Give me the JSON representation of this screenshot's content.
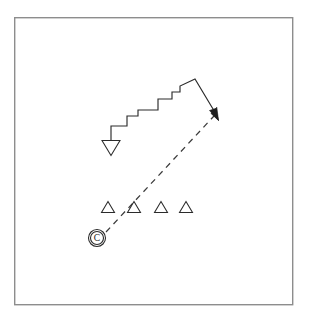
{
  "figure": {
    "title": "",
    "background_color": "#ffffff",
    "frame": {
      "name": "outer-frame",
      "x": 14,
      "y": 17,
      "width": 279,
      "height": 288,
      "stroke_color": "#8d8d8d",
      "fill_color": "#ffffff"
    }
  },
  "chart_data": {
    "type": "diagram",
    "title": "",
    "xlabel": "",
    "ylabel": "",
    "coordinate_space": [
      311,
      325
    ],
    "elements": [
      {
        "id": "route-staircase",
        "label": "staircase-route-path",
        "kind": "polyline",
        "stroke_color": "#2b2b2b",
        "stroke_width": 1.15,
        "dashed": false,
        "points": [
          [
            111,
            140
          ],
          [
            111,
            126
          ],
          [
            127,
            126
          ],
          [
            127,
            116
          ],
          [
            138,
            116
          ],
          [
            138,
            110
          ],
          [
            158,
            110
          ],
          [
            158,
            99
          ],
          [
            172,
            99
          ],
          [
            172,
            92
          ],
          [
            180,
            92
          ],
          [
            180,
            86
          ],
          [
            195,
            79
          ],
          [
            216,
            114
          ]
        ]
      },
      {
        "id": "sight-line",
        "label": "dashed-sight-line",
        "kind": "line",
        "stroke_color": "#3a3a3a",
        "stroke_width": 1.25,
        "dashed": true,
        "dash_pattern": "6 5",
        "from": [
          106,
          232
        ],
        "to": [
          214,
          116
        ]
      }
    ],
    "markers": [
      {
        "id": "marker-inverted-triangle",
        "label": "inverted-triangle-marker",
        "glyph": "triangle-down",
        "x": 111,
        "y": 148,
        "width": 18,
        "height": 15,
        "fill_color": "#ffffff",
        "stroke_color": "#2b2b2b"
      },
      {
        "id": "marker-triangle-1",
        "label": "triangle-marker-1",
        "glyph": "triangle-up",
        "x": 108,
        "y": 207,
        "width": 13,
        "height": 11,
        "fill_color": "#ffffff",
        "stroke_color": "#2b2b2b"
      },
      {
        "id": "marker-triangle-2",
        "label": "triangle-marker-2",
        "glyph": "triangle-up",
        "x": 134,
        "y": 207,
        "width": 13,
        "height": 11,
        "fill_color": "#ffffff",
        "stroke_color": "#2b2b2b"
      },
      {
        "id": "marker-triangle-3",
        "label": "triangle-marker-3",
        "glyph": "triangle-up",
        "x": 161,
        "y": 207,
        "width": 13,
        "height": 11,
        "fill_color": "#ffffff",
        "stroke_color": "#2b2b2b"
      },
      {
        "id": "marker-triangle-4",
        "label": "triangle-marker-4",
        "glyph": "triangle-up",
        "x": 186,
        "y": 207,
        "width": 13,
        "height": 11,
        "fill_color": "#ffffff",
        "stroke_color": "#2b2b2b"
      },
      {
        "id": "marker-circled-c",
        "label": "circled-c-marker",
        "glyph": "circled-letter",
        "letter": "C",
        "x": 97,
        "y": 238,
        "radius": 8.5,
        "fill_color": "#ffffff",
        "stroke_color": "#2b2b2b"
      },
      {
        "id": "arrow-head",
        "label": "route-arrowhead",
        "glyph": "arrowhead",
        "x": 217,
        "y": 117,
        "angle_deg": 59,
        "fill_color": "#1d1d1d"
      }
    ],
    "legend": [],
    "annotations": []
  }
}
